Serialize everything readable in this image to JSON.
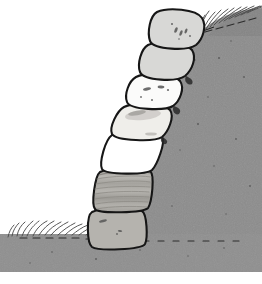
{
  "illustration": {
    "title": "Dry stone retaining wall against earth slope",
    "subject": "stone-retaining-wall",
    "canvas": {
      "width": 262,
      "height": 284
    },
    "background_color": "#ffffff",
    "style": "hand-drawn line illustration, grayscale"
  },
  "palette": {
    "background": "#ffffff",
    "slope_fill": "#8c8c8c",
    "slope_fill_dark": "#7e7e7e",
    "ground_fill": "#8f8f8f",
    "outline": "#161616",
    "grass": "#4a4a4a",
    "stone_light": "#d8d8d6",
    "stone_white": "#ffffff",
    "stone_offwhite": "#f2f1ee",
    "stone_pale": "#ededea",
    "stone_mid": "#b5b3ae",
    "stone_striped": "#a9a7a2",
    "stone_stripe_line": "#8d8b86",
    "speckle": "#3c3c3c"
  },
  "slope": {
    "name": "earth-slope",
    "description": "Gray embankment rising from lower left to upper right, concave curved face",
    "fill": "#8c8c8c",
    "top_edge_y": 8,
    "right_edge_x": 262,
    "has_grass_top": true,
    "texture": "fine speckled noise"
  },
  "ground": {
    "name": "ground-strip",
    "description": "Horizontal gray ground band across the bottom with grass tufts on its upper edge",
    "fill": "#8f8f8f",
    "top_y": 234,
    "bottom_y": 272,
    "has_grass_top": true
  },
  "grass_tufts": {
    "top_slope": {
      "count": 16,
      "region": "top right along slope crest",
      "color": "#4a4a4a"
    },
    "ground": {
      "count": 22,
      "region": "bottom left along ground edge",
      "color": "#4a4a4a"
    }
  },
  "stones": [
    {
      "index": 1,
      "name": "stone-1-top",
      "label": "Top stone",
      "fill": "#d8d8d6",
      "texture": "speckled",
      "speckles": 6,
      "cx": 178,
      "cy": 28,
      "width": 45,
      "height": 35
    },
    {
      "index": 2,
      "name": "stone-2",
      "label": "Second stone",
      "fill": "#d8d8d6",
      "texture": "plain",
      "speckles": 0,
      "cx": 170,
      "cy": 61,
      "width": 45,
      "height": 33
    },
    {
      "index": 3,
      "name": "stone-3",
      "label": "Third stone",
      "fill": "#fbfbfa",
      "texture": "speckled",
      "speckles": 5,
      "cx": 156,
      "cy": 92,
      "width": 46,
      "height": 31
    },
    {
      "index": 4,
      "name": "stone-4",
      "label": "Fourth stone",
      "fill": "#efeeea",
      "texture": "smudged",
      "speckles": 2,
      "cx": 146,
      "cy": 123,
      "width": 48,
      "height": 32
    },
    {
      "index": 5,
      "name": "stone-5-white",
      "label": "Fifth stone, white",
      "fill": "#ffffff",
      "texture": "plain",
      "speckles": 0,
      "cx": 136,
      "cy": 155,
      "width": 50,
      "height": 33
    },
    {
      "index": 6,
      "name": "stone-6-striated",
      "label": "Sixth stone, horizontally banded",
      "fill": "#a9a7a2",
      "texture": "horizontal-striations",
      "stripe_count": 9,
      "speckles": 0,
      "cx": 127,
      "cy": 192,
      "width": 54,
      "height": 40
    },
    {
      "index": 7,
      "name": "stone-7-base",
      "label": "Base stone",
      "fill": "#b5b3ae",
      "texture": "speckled",
      "speckles": 3,
      "cx": 118,
      "cy": 231,
      "width": 55,
      "height": 40
    }
  ],
  "counts": {
    "stones_total": 7
  }
}
